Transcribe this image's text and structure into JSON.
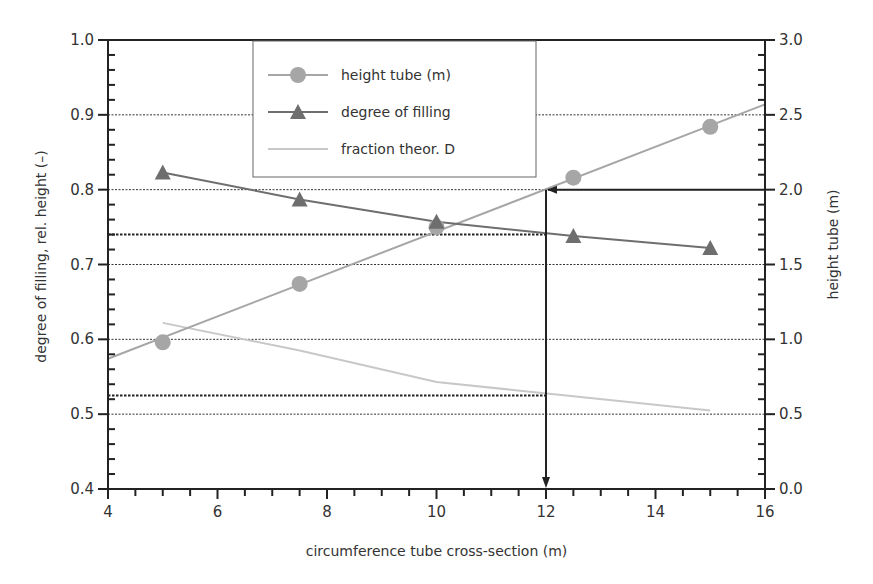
{
  "chart_data": {
    "type": "line",
    "title": "",
    "xlabel": "circumference tube cross-section (m)",
    "ylabel_left": "degree of filling, rel. height (–)",
    "ylabel_right": "height tube (m)",
    "xlim": [
      4,
      16
    ],
    "ylim_left": [
      0.4,
      1.0
    ],
    "ylim_right": [
      0.0,
      3.0
    ],
    "x_ticks": [
      "4",
      "6",
      "8",
      "10",
      "12",
      "14",
      "16"
    ],
    "y_left_ticks": [
      "0.4",
      "0.5",
      "0.6",
      "0.7",
      "0.8",
      "0.9",
      "1.0"
    ],
    "y_right_ticks": [
      "0.0",
      "0.5",
      "1.0",
      "1.5",
      "2.0",
      "2.5",
      "3.0"
    ],
    "grid": "horizontal dotted at 0.5, 0.6, 0.7, 0.8, 0.9 plus reference lines at ~0.74 and ~0.525",
    "legend_position": "top-center",
    "series": [
      {
        "name": "height tube (m)",
        "axis": "right",
        "marker": "circle",
        "color": "#a6a6a6",
        "x": [
          5,
          7.5,
          10,
          12.5,
          15
        ],
        "values": [
          0.98,
          1.37,
          1.75,
          2.08,
          2.42
        ],
        "trend_line": {
          "x": [
            4,
            16
          ],
          "values": [
            0.87,
            2.57
          ]
        }
      },
      {
        "name": "degree of filling",
        "axis": "left",
        "marker": "triangle",
        "color": "#6e6e6e",
        "x": [
          5,
          7.5,
          10,
          12.5,
          15
        ],
        "values": [
          0.823,
          0.787,
          0.757,
          0.738,
          0.722
        ]
      },
      {
        "name": "fraction theor. D",
        "axis": "left",
        "marker": "none",
        "color": "#c8c8c8",
        "x": [
          5,
          7.5,
          10,
          12.5,
          15
        ],
        "values": [
          0.622,
          0.585,
          0.543,
          0.524,
          0.505
        ]
      }
    ],
    "annotations": [
      {
        "type": "arrow",
        "description": "from right axis at height 2.0 m horizontally left to x=12, then down to x-axis at 12",
        "x": 12,
        "y_right": 2.0
      }
    ],
    "reference_lines_left": [
      0.74,
      0.525
    ]
  },
  "legend": {
    "items": [
      {
        "label": "height tube (m)"
      },
      {
        "label": "degree of filling"
      },
      {
        "label": "fraction theor. D"
      }
    ]
  }
}
